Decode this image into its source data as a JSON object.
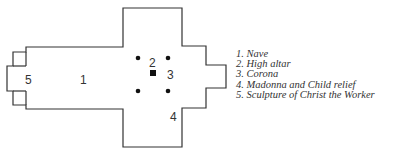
{
  "diagram": {
    "type": "church floor plan",
    "colors": {
      "stroke": "#333333",
      "fill": "#ffffff",
      "text": "#333333"
    },
    "labels": [
      {
        "id": "1",
        "text": "1",
        "x": 84,
        "y": 84
      },
      {
        "id": "2",
        "text": "2",
        "x": 153,
        "y": 66
      },
      {
        "id": "3",
        "text": "3",
        "x": 171,
        "y": 78
      },
      {
        "id": "4",
        "text": "4",
        "x": 174,
        "y": 120
      },
      {
        "id": "5",
        "text": "5",
        "x": 29,
        "y": 84
      }
    ],
    "columns": [
      {
        "x": 138,
        "y": 58
      },
      {
        "x": 168,
        "y": 58
      },
      {
        "x": 138,
        "y": 91
      },
      {
        "x": 168,
        "y": 91
      }
    ],
    "altar": {
      "x": 150,
      "y": 70,
      "size": 6
    }
  },
  "legend": {
    "items": [
      {
        "number": "1.",
        "label": "Nave"
      },
      {
        "number": "2.",
        "label": "High altar"
      },
      {
        "number": "3.",
        "label": "Corona"
      },
      {
        "number": "4.",
        "label": "Madonna and Child relief"
      },
      {
        "number": "5.",
        "label": "Sculpture of Christ the Worker"
      }
    ]
  }
}
